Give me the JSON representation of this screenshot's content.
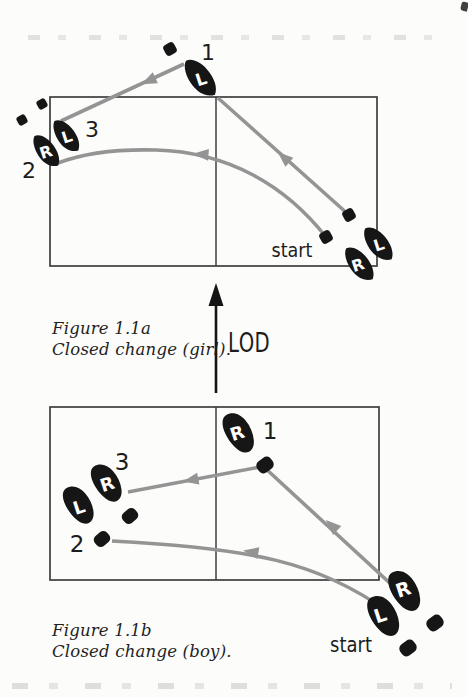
{
  "figure": {
    "lod_label": "LOD",
    "girl": {
      "caption": {
        "line1": "Figure 1.1a",
        "line2": "Closed change (girl)."
      },
      "start_label": "start",
      "numbers": {
        "n1": "1",
        "n2": "2",
        "n3": "3"
      },
      "feet": {
        "step1_letter": "L",
        "step2_letter": "R",
        "step3_letter": "L",
        "start_left_letter": "L",
        "start_right_letter": "R"
      }
    },
    "boy": {
      "caption": {
        "line1": "Figure 1.1b",
        "line2": "Closed change (boy)."
      },
      "start_label": "start",
      "numbers": {
        "n1": "1",
        "n2": "2",
        "n3": "3"
      },
      "feet": {
        "step1_letter": "R",
        "step2_letter": "L",
        "step3_letter": "R",
        "start_left_letter": "L",
        "start_right_letter": "R"
      }
    },
    "colors": {
      "foot_black": "#161616",
      "path_gray": "#949494",
      "box_stroke": "#3e3e3e",
      "text_black": "#1c1c1c"
    }
  }
}
